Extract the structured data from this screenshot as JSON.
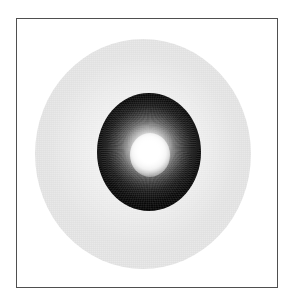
{
  "figure": {
    "caption": "",
    "background_color": "#ffffff",
    "frame": {
      "border_color": "#4f4f4f",
      "border_width_px": 1,
      "fill_color": "#ffffff",
      "left_px": 16,
      "top_px": 18,
      "width_px": 262,
      "height_px": 270
    },
    "elements": {
      "halo": {
        "name": "outer-halo-disc",
        "shape": "circle",
        "center_px": [
          143,
          154
        ],
        "radius_px": 108,
        "fill_color": "#eaeaea",
        "edge_color": "#f4f4f4",
        "opacity": 0.9
      },
      "rim": {
        "name": "gray-rim-ring",
        "shape": "annulus",
        "center_px": [
          149,
          153
        ],
        "outer_radius_px": 57,
        "inner_radius_px": 50,
        "fill_color": "#6e6e6e"
      },
      "sphere": {
        "name": "glowing-sphere",
        "shape": "circle",
        "center_px": [
          149,
          152
        ],
        "radius_px": 52,
        "body_color": "#050505",
        "mid_color": "#6e6e6e",
        "core_color": "#ffffff"
      },
      "core": {
        "name": "bright-core",
        "shape": "circle",
        "center_px": [
          150,
          155
        ],
        "radius_px": 20,
        "fill_color": "#ffffff"
      }
    },
    "palette": {
      "white": "#ffffff",
      "halo_gray": "#eaeaea",
      "rim_gray": "#6e6e6e",
      "body_black": "#050505",
      "frame_gray": "#4f4f4f"
    }
  }
}
